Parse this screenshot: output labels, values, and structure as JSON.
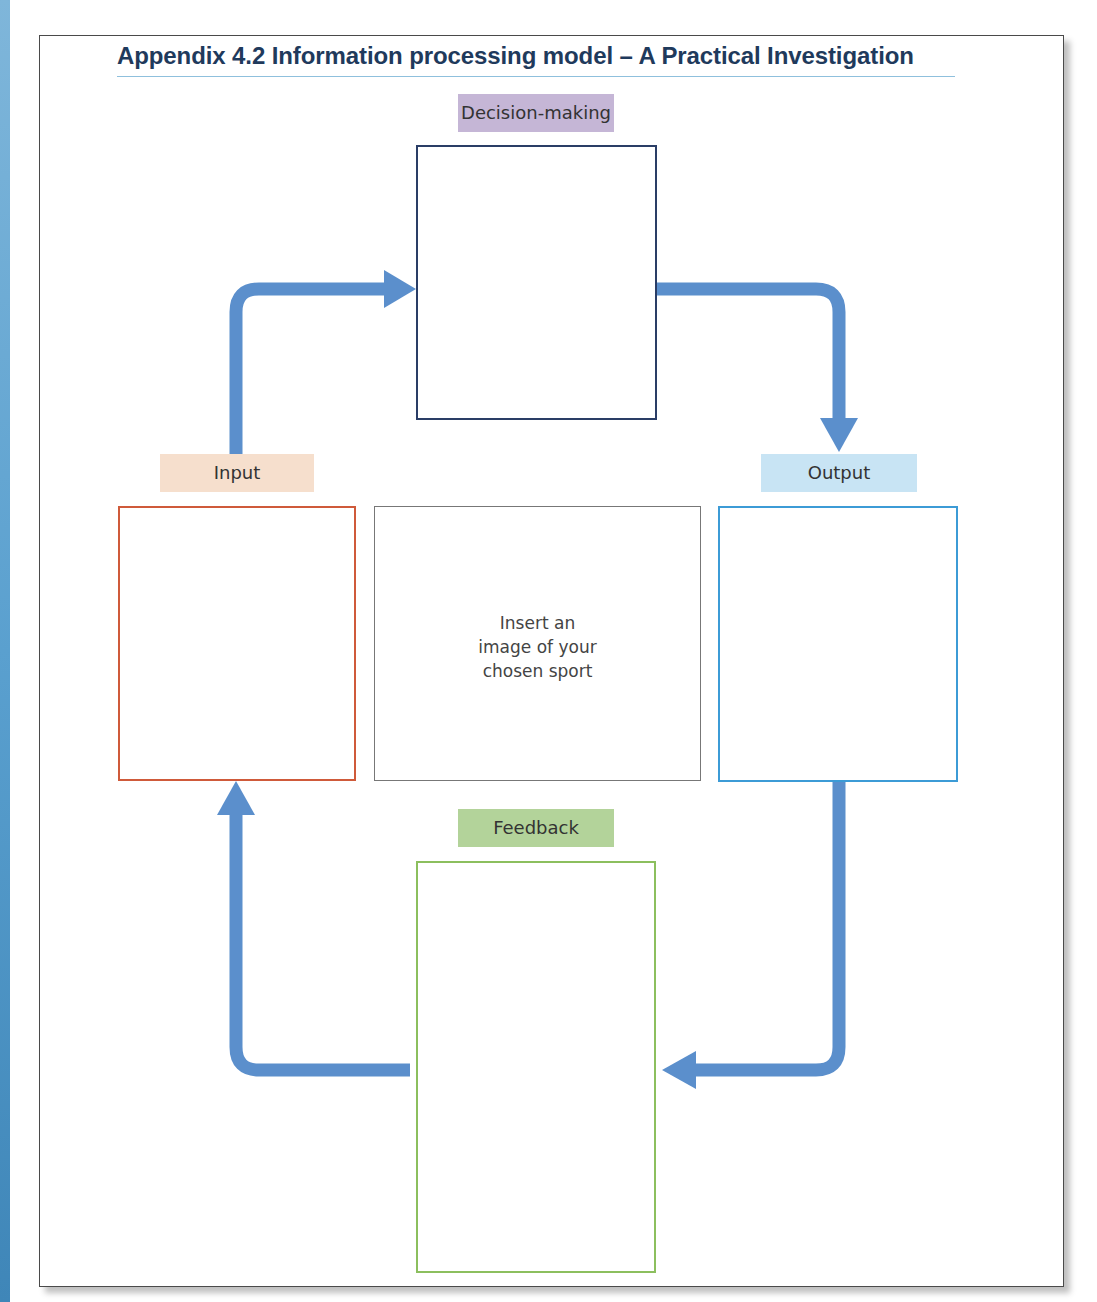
{
  "title": "Appendix 4.2 Information processing model – A Practical Investigation",
  "colors": {
    "title_text": "#1f3a5c",
    "title_rule": "#8fc0dd",
    "arrow": "#5b8fcc",
    "decision_label_bg": "#c5b6d6",
    "decision_border": "#2a3d66",
    "input_label_bg": "#f6dfcd",
    "input_border": "#cf5a3a",
    "output_label_bg": "#c8e4f4",
    "output_border": "#3c9bd6",
    "feedback_label_bg": "#b3d39a",
    "feedback_border": "#8cbf5e",
    "center_border": "#777777"
  },
  "stages": {
    "decision_making": {
      "label": "Decision-making"
    },
    "input": {
      "label": "Input"
    },
    "output": {
      "label": "Output"
    },
    "feedback": {
      "label": "Feedback"
    }
  },
  "center_box": {
    "lines": [
      "Insert an",
      "image of your",
      "chosen sport"
    ]
  },
  "arrows": [
    {
      "from": "input",
      "to": "decision_making",
      "direction": "up-then-right"
    },
    {
      "from": "decision_making",
      "to": "output",
      "direction": "right-then-down"
    },
    {
      "from": "output",
      "to": "feedback",
      "direction": "down-then-left"
    },
    {
      "from": "feedback",
      "to": "input",
      "direction": "left-then-up"
    }
  ]
}
